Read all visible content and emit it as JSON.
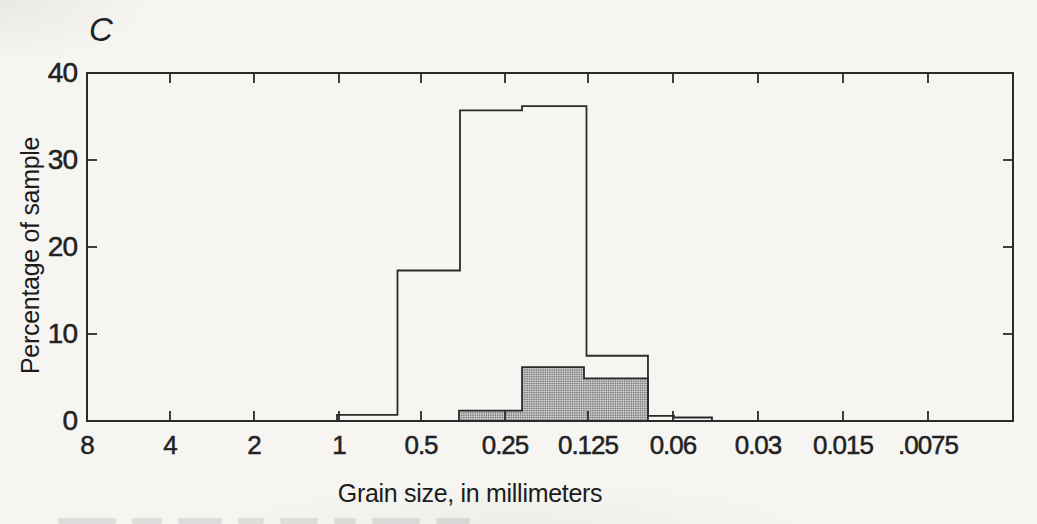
{
  "panel_label": "C",
  "colors": {
    "ink": "#2b2b2b",
    "paper": "#f6f5f2",
    "halftone_dark": "#878787",
    "halftone_light": "#cfcfcf"
  },
  "chart_data": {
    "type": "histogram",
    "title": "",
    "panel_label": "C",
    "xlabel": "Grain size, in millimeters",
    "ylabel": "Percentage of sample",
    "x_scale": "log2-descending-millimeters",
    "grid": "off",
    "legend": "none",
    "x_ticks": [
      {
        "label": "8",
        "pos": 0.0
      },
      {
        "label": "4",
        "pos": 0.0896
      },
      {
        "label": "2",
        "pos": 0.1803
      },
      {
        "label": "1",
        "pos": 0.2721
      },
      {
        "label": "0.5",
        "pos": 0.3607
      },
      {
        "label": "0.25",
        "pos": 0.4514
      },
      {
        "label": "0.125",
        "pos": 0.541
      },
      {
        "label": "0.06",
        "pos": 0.6328
      },
      {
        "label": "0.03",
        "pos": 0.7246
      },
      {
        "label": "0.015",
        "pos": 0.8164
      },
      {
        "label": ".0075",
        "pos": 0.9082
      }
    ],
    "ylim": [
      0,
      40
    ],
    "y_ticks": [
      0,
      10,
      20,
      30,
      40
    ],
    "series": [
      {
        "name": "open-histogram",
        "style": "outline-unfilled",
        "edges_pos": [
          0.27,
          0.3353,
          0.4028,
          0.4698,
          0.5394,
          0.6058,
          0.6339,
          0.6749
        ],
        "edges_mm_approx": [
          1.0,
          0.62,
          0.37,
          0.22,
          0.13,
          0.078,
          0.063,
          0.046
        ],
        "values_percent": [
          0.7,
          17.3,
          35.7,
          36.2,
          7.5,
          0.6,
          0.4
        ]
      },
      {
        "name": "shaded-histogram",
        "style": "halftone-filled",
        "edges_pos": [
          0.4017,
          0.4698,
          0.5367,
          0.6058
        ],
        "edges_mm_approx": [
          0.37,
          0.22,
          0.134,
          0.078
        ],
        "values_percent": [
          1.2,
          6.2,
          4.9
        ]
      }
    ]
  }
}
